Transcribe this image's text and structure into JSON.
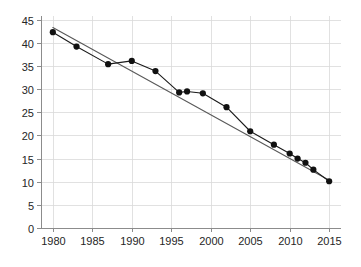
{
  "chart_data": {
    "type": "line",
    "title": "",
    "subtitle": "",
    "xlabel": "",
    "ylabel": "",
    "xlim": [
      1978.5,
      2016.5
    ],
    "ylim": [
      0,
      45.8
    ],
    "grid": true,
    "legend": null,
    "x_ticks": [
      1980,
      1985,
      1990,
      1995,
      2000,
      2005,
      2010,
      2015
    ],
    "y_ticks": [
      0,
      5,
      10,
      15,
      20,
      25,
      30,
      35,
      40,
      45
    ],
    "series": [
      {
        "name": "observed",
        "style": "line-with-markers",
        "color": "#111111",
        "x": [
          1980,
          1983,
          1987,
          1990,
          1993,
          1996,
          1997,
          1999,
          2002,
          2005,
          2008,
          2010,
          2011,
          2012,
          2013,
          2015
        ],
        "values": [
          42.3,
          39.2,
          35.4,
          36.1,
          33.9,
          29.3,
          29.5,
          29.1,
          26.1,
          20.9,
          18.0,
          16.1,
          15.0,
          14.1,
          12.6,
          10.1
        ]
      },
      {
        "name": "linear-trend",
        "style": "line",
        "color": "#595959",
        "x": [
          1980,
          2015
        ],
        "values": [
          43.3,
          10.3
        ]
      }
    ]
  }
}
